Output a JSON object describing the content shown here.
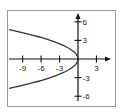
{
  "chart_data": {
    "type": "line",
    "title": "",
    "xlabel": "",
    "ylabel": "",
    "equation": "x = -y^2 / 2",
    "xlim": [
      -11.2,
      6.3
    ],
    "ylim": [
      -7.8,
      7.8
    ],
    "grid": false,
    "legend": null,
    "x_ticks": [
      -9,
      -6,
      -3,
      3
    ],
    "x_tick_labels": [
      "-9",
      "-6",
      "-3",
      "3"
    ],
    "y_ticks": [
      6,
      3,
      -3,
      -6
    ],
    "y_tick_labels": [
      "6",
      "3",
      "-3",
      "-6"
    ],
    "series": [
      {
        "name": "parabola",
        "color": "#333333",
        "points": [
          {
            "x": -11.2,
            "y": 4.73
          },
          {
            "x": -8,
            "y": 4
          },
          {
            "x": -4.5,
            "y": 3
          },
          {
            "x": -2,
            "y": 2
          },
          {
            "x": -0.5,
            "y": 1
          },
          {
            "x": 0,
            "y": 0
          },
          {
            "x": -0.5,
            "y": -1
          },
          {
            "x": -2,
            "y": -2
          },
          {
            "x": -4.5,
            "y": -3
          },
          {
            "x": -8,
            "y": -4
          },
          {
            "x": -11.2,
            "y": -4.73
          }
        ]
      }
    ]
  },
  "colors": {
    "frame": "#9a9a9a",
    "axis": "#111111",
    "curve": "#333333"
  }
}
